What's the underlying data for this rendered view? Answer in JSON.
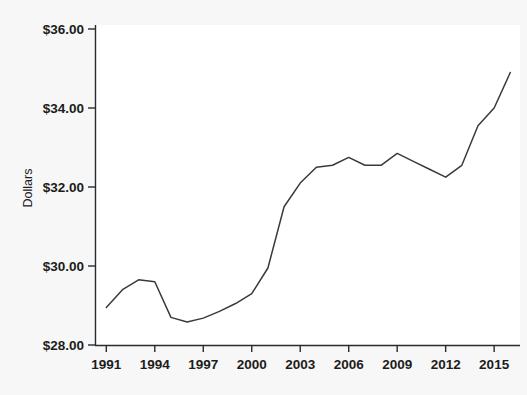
{
  "chart_data": {
    "type": "line",
    "title": "",
    "subtitle": "",
    "xlabel": "",
    "ylabel": "Dollars",
    "xlim": [
      1990.3,
      2016.6
    ],
    "ylim": [
      28.0,
      36.0
    ],
    "grid": false,
    "legend": null,
    "y_tick_labels": [
      "$28.00",
      "$30.00",
      "$32.00",
      "$34.00",
      "$36.00"
    ],
    "y_tick_values": [
      28,
      30,
      32,
      34,
      36
    ],
    "x_tick_labels": [
      "1991",
      "1994",
      "1997",
      "2000",
      "2003",
      "2006",
      "2009",
      "2012",
      "2015"
    ],
    "x_tick_values": [
      1991,
      1994,
      1997,
      2000,
      2003,
      2006,
      2009,
      2012,
      2015
    ],
    "line_color": "#3a3a3a",
    "x": [
      1991,
      1992,
      1993,
      1994,
      1995,
      1996,
      1997,
      1998,
      1999,
      2000,
      2001,
      2002,
      2003,
      2004,
      2005,
      2006,
      2007,
      2008,
      2009,
      2010,
      2011,
      2012,
      2013,
      2014,
      2015,
      2016
    ],
    "values": [
      28.95,
      29.4,
      29.65,
      29.6,
      28.7,
      28.58,
      28.68,
      28.85,
      29.05,
      29.3,
      29.95,
      31.5,
      32.1,
      32.5,
      32.55,
      32.75,
      32.55,
      32.55,
      32.85,
      32.65,
      32.45,
      32.25,
      32.55,
      33.55,
      34.0,
      34.9
    ],
    "series": [
      {
        "name": "Dollars",
        "values": [
          28.95,
          29.4,
          29.65,
          29.6,
          28.7,
          28.58,
          28.68,
          28.85,
          29.05,
          29.3,
          29.95,
          31.5,
          32.1,
          32.5,
          32.55,
          32.75,
          32.55,
          32.55,
          32.85,
          32.65,
          32.45,
          32.25,
          32.55,
          33.55,
          34.0,
          34.9
        ]
      }
    ]
  },
  "axes": {
    "y_label": "Dollars",
    "y_ticks": [
      {
        "label": "$36.00",
        "value": 36
      },
      {
        "label": "$34.00",
        "value": 34
      },
      {
        "label": "$32.00",
        "value": 32
      },
      {
        "label": "$30.00",
        "value": 30
      },
      {
        "label": "$28.00",
        "value": 28
      }
    ],
    "x_ticks": [
      {
        "label": "1991",
        "value": 1991
      },
      {
        "label": "1994",
        "value": 1994
      },
      {
        "label": "1997",
        "value": 1997
      },
      {
        "label": "2000",
        "value": 2000
      },
      {
        "label": "2003",
        "value": 2003
      },
      {
        "label": "2006",
        "value": 2006
      },
      {
        "label": "2009",
        "value": 2009
      },
      {
        "label": "2012",
        "value": 2012
      },
      {
        "label": "2015",
        "value": 2015
      }
    ]
  },
  "colors": {
    "background": "#f7f7f7",
    "plot_background": "#ffffff",
    "line": "#3a3a3a",
    "axis": "#2a2a2a",
    "text": "#1c1c1c"
  }
}
